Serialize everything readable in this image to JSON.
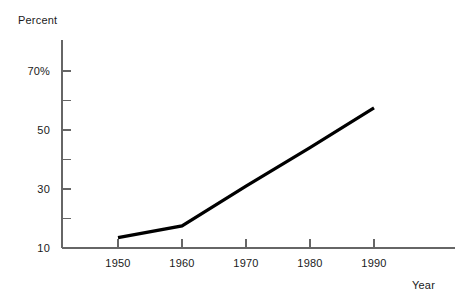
{
  "chart_data": {
    "type": "line",
    "title": "",
    "subtitle": "",
    "xlabel": "Year",
    "ylabel": "Percent",
    "x": [
      1950,
      1960,
      1970,
      1980,
      1990
    ],
    "series": [
      {
        "name": "Percent",
        "values": [
          13.5,
          17.5,
          31,
          44,
          57.5
        ]
      }
    ],
    "xlim": [
      1945,
      1995
    ],
    "ylim": [
      5,
      75
    ],
    "grid": false,
    "legend": null,
    "legend_position": "none",
    "line_color": "#000000",
    "axis_color": "#666666",
    "x_ticks": [
      {
        "value": 1950,
        "label": "1950"
      },
      {
        "value": 1960,
        "label": "1960"
      },
      {
        "value": 1970,
        "label": "1970"
      },
      {
        "value": 1980,
        "label": "1980"
      },
      {
        "value": 1990,
        "label": "1990"
      }
    ],
    "y_ticks": [
      {
        "value": 10,
        "label": "10",
        "major": true
      },
      {
        "value": 20,
        "label": "",
        "major": false
      },
      {
        "value": 30,
        "label": "30",
        "major": true
      },
      {
        "value": 40,
        "label": "",
        "major": false
      },
      {
        "value": 50,
        "label": "50",
        "major": true
      },
      {
        "value": 60,
        "label": "",
        "major": false
      },
      {
        "value": 70,
        "label": "70%",
        "major": true
      }
    ]
  },
  "axis_titles": {
    "y": "Percent",
    "x": "Year"
  }
}
